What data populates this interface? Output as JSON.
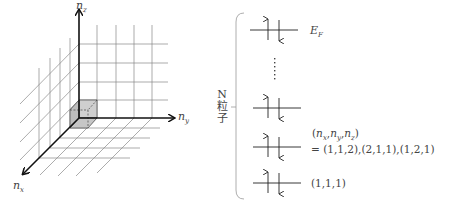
{
  "left_diagram": {
    "title": "3D quantum number lattice",
    "axes": {
      "z": {
        "label": "n",
        "sub": "z"
      },
      "y": {
        "label": "n",
        "sub": "y"
      },
      "x": {
        "label": "n",
        "sub": "x"
      }
    },
    "highlighted_cell": "unit cube at origin (1,1,1)"
  },
  "right_diagram": {
    "bracket_label_top": "N",
    "bracket_label_mid": "粒",
    "bracket_label_bot": "子",
    "levels": [
      {
        "name": "fermi",
        "label": "E",
        "label_sub": "F"
      },
      {
        "name": "dots",
        "label": "⋮"
      },
      {
        "name": "level3",
        "label": ""
      },
      {
        "name": "level2",
        "label_line1": "(n_x, n_y, n_z)",
        "label_line2": "= (1,1,2),(2,1,1),(1,2,1)"
      },
      {
        "name": "level1",
        "label": "(1,1,1)"
      }
    ],
    "level2_tuple": {
      "open": "(",
      "a": "n",
      "as": "x",
      "b": "n",
      "bs": "y",
      "c": "n",
      "cs": "z",
      "close": ")"
    },
    "level2_eq": "= (1,1,2),(2,1,1),(1,2,1)",
    "level1_text": "(1,1,1)"
  }
}
